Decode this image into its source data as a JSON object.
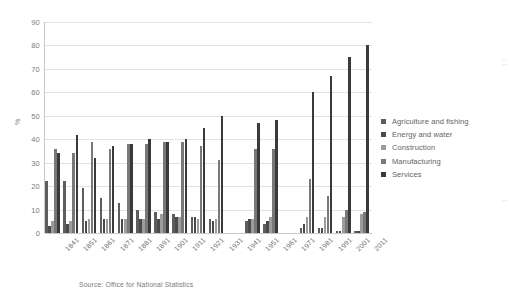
{
  "chart_data": {
    "type": "bar",
    "title": "",
    "subtitle": "",
    "xlabel": "",
    "ylabel": "%",
    "ylim": [
      0,
      90
    ],
    "ytick_step": 10,
    "yticks": [
      0,
      10,
      20,
      30,
      40,
      50,
      60,
      70,
      80,
      90
    ],
    "grid": true,
    "legend_position": "right",
    "categories": [
      "1841",
      "1851",
      "1861",
      "1871",
      "1881",
      "1891",
      "1901",
      "1911",
      "1921",
      "1931",
      "1941",
      "1951",
      "1961",
      "1971",
      "1981",
      "1991",
      "2001",
      "2011"
    ],
    "missing_categories": [
      "1941",
      "1971"
    ],
    "series": [
      {
        "name": "Agriculture and fishing",
        "color": "#5d5d5d",
        "values": [
          22,
          22,
          19,
          15,
          13,
          10,
          9,
          8,
          7,
          6,
          null,
          5,
          4,
          null,
          2,
          2,
          1,
          1
        ]
      },
      {
        "name": "Energy and water",
        "color": "#4a4a4a",
        "values": [
          3,
          4,
          5,
          6,
          6,
          6,
          6,
          7,
          7,
          5,
          null,
          6,
          5,
          null,
          4,
          2,
          1,
          1
        ]
      },
      {
        "name": "Construction",
        "color": "#9c9c9c",
        "values": [
          5,
          5,
          6,
          6,
          6,
          6,
          8,
          7,
          6,
          6,
          null,
          6,
          7,
          null,
          7,
          7,
          7,
          8
        ]
      },
      {
        "name": "Manufacturing",
        "color": "#787878",
        "values": [
          36,
          34,
          39,
          36,
          38,
          38,
          39,
          39,
          37,
          31,
          null,
          36,
          36,
          null,
          23,
          16,
          10,
          9
        ]
      },
      {
        "name": "Services",
        "color": "#3a3a3a",
        "values": [
          34,
          42,
          32,
          37,
          38,
          40,
          39,
          40,
          45,
          50,
          null,
          47,
          48,
          null,
          60,
          67,
          75,
          80
        ]
      }
    ],
    "source_note": "Source: Office for National Statistics"
  },
  "legend": {
    "items": [
      {
        "label": "Agriculture and fishing"
      },
      {
        "label": "Energy and water"
      },
      {
        "label": "Construction"
      },
      {
        "label": "Manufacturing"
      },
      {
        "label": "Services"
      }
    ]
  },
  "axis": {
    "y_title": "%"
  },
  "footer": {
    "source": "Source: Office for National Statistics"
  }
}
